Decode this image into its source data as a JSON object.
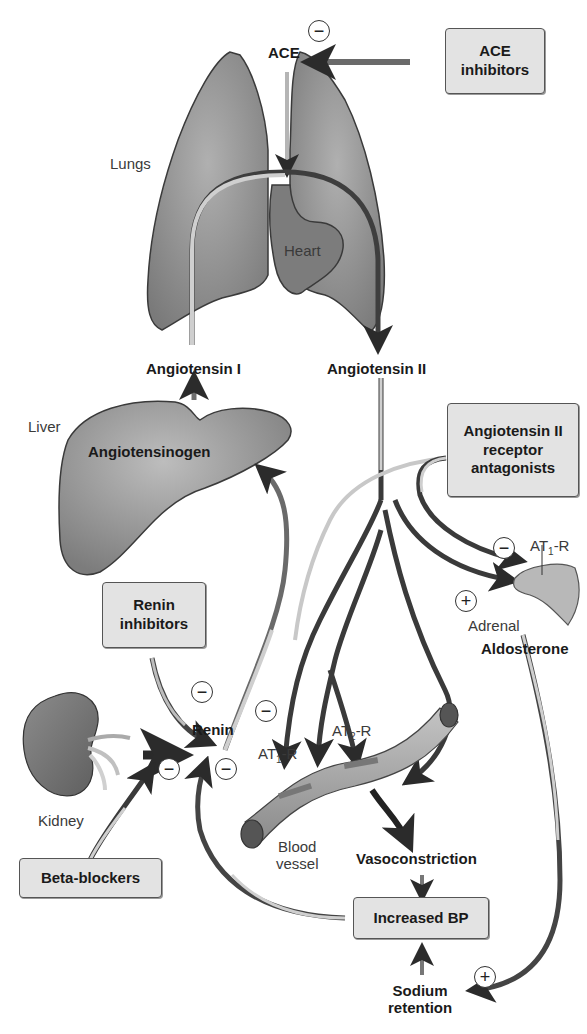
{
  "organs": {
    "lungs": "Lungs",
    "heart": "Heart",
    "liver": "Liver",
    "kidney": "Kidney",
    "adrenal": "Adrenal",
    "blood_vessel_line1": "Blood",
    "blood_vessel_line2": "vessel"
  },
  "molecules": {
    "ace": "ACE",
    "angiotensin_i": "Angiotensin I",
    "angiotensin_ii": "Angiotensin II",
    "angiotensinogen": "Angiotensinogen",
    "renin": "Renin",
    "aldosterone": "Aldosterone"
  },
  "receptors": {
    "at1_vessel": {
      "base": "AT",
      "sub": "1",
      "suffix": "-R"
    },
    "at2_vessel": {
      "base": "AT",
      "sub": "2",
      "suffix": "-R"
    },
    "at1_adrenal": {
      "base": "AT",
      "sub": "1",
      "suffix": "-R"
    }
  },
  "effects": {
    "vasoconstriction": "Vasoconstriction",
    "increased_bp": "Increased BP",
    "sodium_retention_line1": "Sodium",
    "sodium_retention_line2": "retention"
  },
  "drug_boxes": {
    "ace_inhibitors": {
      "line1": "ACE",
      "line2": "inhibitors"
    },
    "arb": {
      "line1": "Angiotensin II",
      "line2": "receptor",
      "line3": "antagonists"
    },
    "renin_inhibitors": {
      "line1": "Renin",
      "line2": "inhibitors"
    },
    "beta_blockers": {
      "line1": "Beta-blockers"
    }
  },
  "signs": {
    "minus": "−",
    "plus": "+"
  },
  "colors": {
    "organ_fill": "#8a8a8a",
    "organ_stroke": "#3a3a3a",
    "arrow_dark": "#2e2e2e",
    "arrow_light": "#c8c8c8",
    "box_fill": "#e3e3e3"
  }
}
